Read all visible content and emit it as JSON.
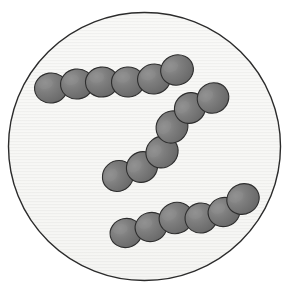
{
  "figure": {
    "kind": "microscopy-illustration",
    "subject_label": "Streptococcus chains (cocci in chains)",
    "caption": "",
    "field": {
      "shape": "circle",
      "label": "microscope-field-of-view",
      "center_x": 144.5,
      "center_y": 146.5,
      "radius_x": 136,
      "radius_y": 134,
      "fill_color": "#f7f7f5",
      "stroke_color": "#2b2b2b",
      "stroke_width": 1.4,
      "texture": "faint horizontal scan lines",
      "texture_color": "#e9e9e6"
    },
    "cell_style": {
      "fill_color": "#787878",
      "highlight_color": "#8e8e8e",
      "shadow_color": "#5e5e5e",
      "stroke_color": "#2e2e2e",
      "stroke_width": 1.1,
      "shape": "sphere",
      "count_total": 18
    },
    "chains": [
      {
        "name": "top-chain",
        "label": "Chain 1 — upper horizontal chain",
        "cell_count": 6,
        "orientation": "horizontal, rising slightly to the right",
        "cells": [
          {
            "cx": 51,
            "cy": 88,
            "rx": 16.5,
            "ry": 15.0,
            "rot": -8
          },
          {
            "cx": 77,
            "cy": 84,
            "rx": 16.5,
            "ry": 15.0,
            "rot": -8
          },
          {
            "cx": 102,
            "cy": 82,
            "rx": 16.5,
            "ry": 15.0,
            "rot": -6
          },
          {
            "cx": 128,
            "cy": 82,
            "rx": 16.5,
            "ry": 15.0,
            "rot": -4
          },
          {
            "cx": 154,
            "cy": 79,
            "rx": 16.5,
            "ry": 15.0,
            "rot": -10
          },
          {
            "cx": 177,
            "cy": 70,
            "rx": 16.5,
            "ry": 15.0,
            "rot": -18
          }
        ]
      },
      {
        "name": "middle-chain",
        "label": "Chain 2 — middle diagonal chain",
        "cell_count": 6,
        "orientation": "diagonal, lower-left to upper-right",
        "cells": [
          {
            "cx": 118,
            "cy": 176,
            "rx": 16.0,
            "ry": 15.0,
            "rot": -42
          },
          {
            "cx": 142,
            "cy": 167,
            "rx": 16.0,
            "ry": 15.0,
            "rot": -40
          },
          {
            "cx": 162,
            "cy": 152,
            "rx": 16.5,
            "ry": 15.5,
            "rot": -40
          },
          {
            "cx": 172,
            "cy": 127,
            "rx": 16.5,
            "ry": 15.5,
            "rot": -50
          },
          {
            "cx": 190,
            "cy": 108,
            "rx": 16.0,
            "ry": 15.0,
            "rot": -40
          },
          {
            "cx": 213,
            "cy": 98,
            "rx": 16.0,
            "ry": 15.0,
            "rot": -30
          }
        ]
      },
      {
        "name": "bottom-chain",
        "label": "Chain 3 — lower diagonal chain",
        "cell_count": 6,
        "orientation": "diagonal, lower-left to upper-right",
        "cells": [
          {
            "cx": 126,
            "cy": 233,
            "rx": 16.0,
            "ry": 14.5,
            "rot": -12
          },
          {
            "cx": 151,
            "cy": 227,
            "rx": 16.0,
            "ry": 14.5,
            "rot": -16
          },
          {
            "cx": 176,
            "cy": 218,
            "rx": 17.0,
            "ry": 15.5,
            "rot": -20
          },
          {
            "cx": 201,
            "cy": 218,
            "rx": 16.0,
            "ry": 15.0,
            "rot": -8
          },
          {
            "cx": 224,
            "cy": 212,
            "rx": 16.0,
            "ry": 14.5,
            "rot": -16
          },
          {
            "cx": 243,
            "cy": 199,
            "rx": 16.5,
            "ry": 15.0,
            "rot": -28
          }
        ]
      }
    ]
  }
}
